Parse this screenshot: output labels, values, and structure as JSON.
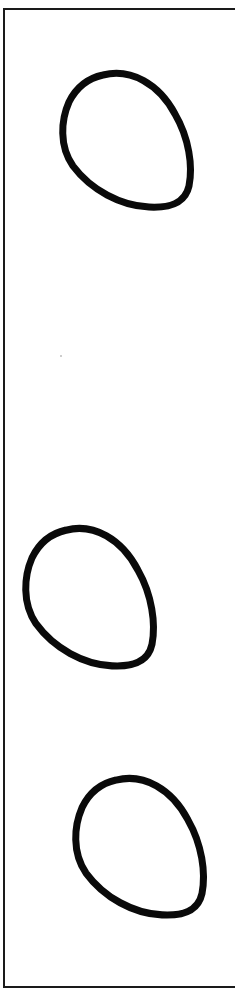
{
  "drawing": {
    "title": "Three egg outlines",
    "frame": {
      "stroke_color": "#1a1a1a",
      "sides_visible": [
        "top",
        "left",
        "bottom"
      ]
    },
    "shapes": [
      {
        "label": "Egg outline 1",
        "x": 59,
        "y": 70,
        "width": 136,
        "height": 142,
        "stroke_color": "#0a0a0a",
        "fill": "none"
      },
      {
        "label": "Egg outline 2",
        "x": 22,
        "y": 525,
        "width": 136,
        "height": 146,
        "stroke_color": "#0a0a0a",
        "fill": "none"
      },
      {
        "label": "Egg outline 3",
        "x": 72,
        "y": 775,
        "width": 136,
        "height": 145,
        "stroke_color": "#0a0a0a",
        "fill": "none"
      }
    ]
  }
}
